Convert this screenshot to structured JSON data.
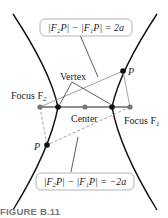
{
  "figure": {
    "caption": "FIGURE B.11",
    "labels": {
      "vertex": "Vertex",
      "center": "Center",
      "focus_f2": "Focus F",
      "focus_f2_sub": "2",
      "focus_f1": "Focus F",
      "focus_f1_sub": "1",
      "point_upper": "P",
      "point_lower": "P"
    },
    "equations": {
      "upper": "|F₂P| − |F₁P| = 2a",
      "lower": "|F₂P| − |F₁P| = −2a"
    },
    "colors": {
      "curve": "#111111",
      "axis": "#666666",
      "focus_point": "#777777",
      "construction_line": "#999999"
    }
  }
}
